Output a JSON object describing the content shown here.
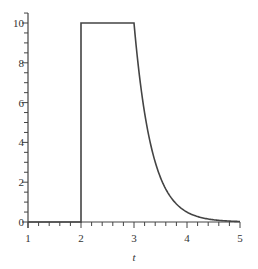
{
  "chart_data": {
    "type": "line",
    "title": "",
    "xlabel": "t",
    "ylabel": "",
    "xlim": [
      1,
      5
    ],
    "ylim": [
      0,
      10.5
    ],
    "grid": false,
    "legend": null,
    "x_ticks": [
      1,
      2,
      3,
      4,
      5
    ],
    "x_tick_labels": [
      "1",
      "2",
      "3",
      "4",
      "5"
    ],
    "x_minor_step": 0.2,
    "y_ticks": [
      0,
      2,
      4,
      6,
      8,
      10
    ],
    "y_tick_labels": [
      "0",
      "2",
      "4",
      "6",
      "8",
      "10"
    ],
    "y_minor_step": 0.5,
    "series": [
      {
        "name": "f(t)",
        "color": "#444444",
        "description": "0 for t<2, jumps to 10 at t=2, constant 10 on [2,3], then exponential decay 10*exp(-3(t-3)) for t>3",
        "x": [
          1,
          2,
          2,
          3,
          3.1,
          3.2,
          3.3,
          3.4,
          3.5,
          3.6,
          3.7,
          3.8,
          3.9,
          4.0,
          4.2,
          4.4,
          4.6,
          4.8,
          5.0
        ],
        "y": [
          0,
          0,
          10,
          10,
          7.41,
          5.49,
          4.07,
          3.01,
          2.23,
          1.65,
          1.22,
          0.91,
          0.67,
          0.5,
          0.27,
          0.15,
          0.08,
          0.05,
          0.02
        ]
      }
    ]
  }
}
